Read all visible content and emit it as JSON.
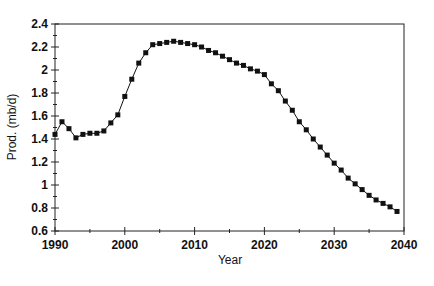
{
  "chart_data": {
    "type": "line",
    "title": "",
    "xlabel": "Year",
    "ylabel": "Prod. (mb/d)",
    "xlim": [
      1990,
      2040
    ],
    "ylim": [
      0.6,
      2.4
    ],
    "xticks": [
      1990,
      2000,
      2010,
      2020,
      2030,
      2040
    ],
    "yticks": [
      0.6,
      0.8,
      1,
      1.2,
      1.4,
      1.6,
      1.8,
      2,
      2.2,
      2.4
    ],
    "xtick_labels": [
      "1990",
      "2000",
      "2010",
      "2020",
      "2030",
      "2040"
    ],
    "ytick_labels": [
      "0.6",
      "0.8",
      "1",
      "1.2",
      "1.4",
      "1.6",
      "1.8",
      "2",
      "2.2",
      "2.4"
    ],
    "grid": false,
    "legend": null,
    "series": [
      {
        "name": "Production",
        "marker": "square",
        "color": "#111111",
        "x": [
          1990,
          1991,
          1992,
          1993,
          1994,
          1995,
          1996,
          1997,
          1998,
          1999,
          2000,
          2001,
          2002,
          2003,
          2004,
          2005,
          2006,
          2007,
          2008,
          2009,
          2010,
          2011,
          2012,
          2013,
          2014,
          2015,
          2016,
          2017,
          2018,
          2019,
          2020,
          2021,
          2022,
          2023,
          2024,
          2025,
          2026,
          2027,
          2028,
          2029,
          2030,
          2031,
          2032,
          2033,
          2034,
          2035,
          2036,
          2037,
          2038,
          2039
        ],
        "values": [
          1.44,
          1.55,
          1.49,
          1.41,
          1.44,
          1.45,
          1.45,
          1.47,
          1.54,
          1.61,
          1.77,
          1.92,
          2.06,
          2.15,
          2.22,
          2.23,
          2.24,
          2.25,
          2.24,
          2.23,
          2.22,
          2.2,
          2.17,
          2.15,
          2.12,
          2.09,
          2.06,
          2.04,
          2.01,
          1.99,
          1.96,
          1.88,
          1.82,
          1.73,
          1.65,
          1.55,
          1.48,
          1.4,
          1.33,
          1.26,
          1.19,
          1.13,
          1.06,
          1.01,
          0.96,
          0.91,
          0.87,
          0.84,
          0.81,
          0.77
        ]
      }
    ]
  },
  "axes": {
    "xlabel": "Year",
    "ylabel": "Prod. (mb/d)"
  }
}
